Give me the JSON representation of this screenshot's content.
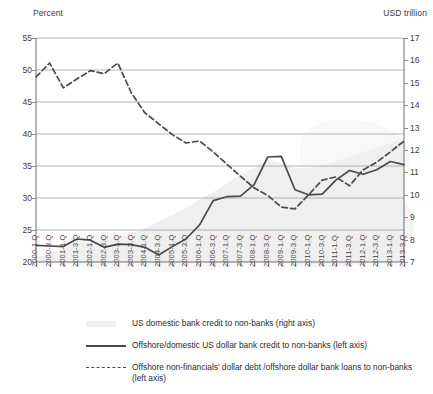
{
  "labels": {
    "left_axis_title": "Percent",
    "right_axis_title": "USD trillion"
  },
  "legend": [
    {
      "key": "area",
      "text": "US domestic bank credit to non-banks (right axis)"
    },
    {
      "key": "solid",
      "text": "Offshore/domestic US dollar bank credit to non-banks (left axis)"
    },
    {
      "key": "dashed",
      "text": "Offshore non-financials’ dollar debt /offshore dollar bank loans to non-banks (left axis)"
    }
  ],
  "colors": {
    "solid_line": "#4a4a4a",
    "dashed_line": "#4a4a4a",
    "area_fill": "#efefef",
    "gridline": "#9a9a9a",
    "axis": "#6f6f6f",
    "text": "#2b2b2b"
  },
  "chart_data": {
    "type": "line",
    "title": "",
    "xlabel": "",
    "ylabel": "Percent",
    "y2label": "USD trillion",
    "ylim": [
      20,
      55
    ],
    "y2lim": [
      7,
      17
    ],
    "yticks": [
      20,
      25,
      30,
      35,
      40,
      45,
      50,
      55
    ],
    "y2ticks": [
      7,
      8,
      9,
      10,
      11,
      12,
      13,
      14,
      15,
      16,
      17
    ],
    "grid": "horizontal",
    "legend_position": "below",
    "categories": [
      "2000-1.Q",
      "2000-3.Q",
      "2001-1.Q",
      "2001-3.Q",
      "2002-1.Q",
      "2002-3.Q",
      "2003-1.Q",
      "2003-3.Q",
      "2004-1.Q",
      "2004-3.Q",
      "2005-1.Q",
      "2005-3.Q",
      "2006-1.Q",
      "2006-3.Q",
      "2007-1.Q",
      "2007-3.Q",
      "2008-1.Q",
      "2008-3.Q",
      "2009-1.Q",
      "2009-3.Q",
      "2010-1.Q",
      "2010-3.Q",
      "2011-1.Q",
      "2011-3.Q",
      "2012-1.Q",
      "2012-3.Q",
      "2013-1.Q",
      "2013-3.Q"
    ],
    "series": [
      {
        "name": "Offshore/domestic US dollar bank credit to non-banks (left axis)",
        "axis": "left",
        "style": "solid",
        "values": [
          22.6,
          22.5,
          22.4,
          23.6,
          23.4,
          22.3,
          22.8,
          22.7,
          22.3,
          21.1,
          22.4,
          23.6,
          25.8,
          29.6,
          30.2,
          30.3,
          32.1,
          36.4,
          36.5,
          31.3,
          30.5,
          30.6,
          32.8,
          34.3,
          33.7,
          34.4,
          35.7,
          35.2
        ]
      },
      {
        "name": "Offshore non-financials’ dollar debt /offshore dollar bank loans to non-banks (left axis)",
        "axis": "left",
        "style": "dashed",
        "values": [
          48.9,
          51.1,
          47.2,
          48.6,
          49.9,
          49.4,
          51.1,
          46.4,
          43.3,
          41.6,
          39.9,
          38.6,
          38.9,
          37.2,
          35.3,
          33.4,
          31.6,
          30.4,
          28.6,
          28.3,
          30.5,
          32.8,
          33.3,
          31.9,
          34.4,
          35.6,
          37.2,
          38.9
        ]
      },
      {
        "name": "US domestic bank credit to non-banks (right axis)",
        "axis": "right",
        "style": "area",
        "values": [
          7.2,
          7.4,
          7.6,
          7.8,
          7.9,
          8.0,
          8.1,
          8.3,
          8.5,
          8.8,
          9.1,
          9.4,
          9.8,
          10.1,
          10.5,
          10.9,
          11.2,
          11.6,
          11.4,
          11.2,
          11.2,
          11.3,
          11.5,
          11.7,
          11.9,
          12.1,
          12.3,
          12.5
        ]
      }
    ]
  }
}
